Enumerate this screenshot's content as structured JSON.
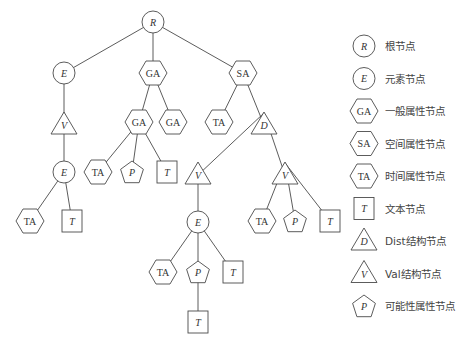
{
  "diagram": {
    "type": "tree",
    "nodes": [
      {
        "id": "R",
        "kind": "circle",
        "label": "R",
        "italic": true,
        "x": 153,
        "y": 22
      },
      {
        "id": "E1",
        "kind": "circle",
        "label": "E",
        "italic": true,
        "x": 64,
        "y": 73
      },
      {
        "id": "GA1",
        "kind": "hexagon",
        "label": "GA",
        "italic": false,
        "x": 153,
        "y": 73
      },
      {
        "id": "SA1",
        "kind": "hexagon",
        "label": "SA",
        "italic": false,
        "x": 243,
        "y": 73
      },
      {
        "id": "V1",
        "kind": "triangle",
        "label": "V",
        "italic": true,
        "x": 64,
        "y": 125
      },
      {
        "id": "GA2",
        "kind": "hexagon",
        "label": "GA",
        "italic": false,
        "x": 139,
        "y": 122
      },
      {
        "id": "GA3",
        "kind": "hexagon",
        "label": "GA",
        "italic": false,
        "x": 173,
        "y": 122
      },
      {
        "id": "TA1",
        "kind": "hexagon",
        "label": "TA",
        "italic": false,
        "x": 219,
        "y": 122
      },
      {
        "id": "D1",
        "kind": "triangle",
        "label": "D",
        "italic": true,
        "x": 264,
        "y": 125
      },
      {
        "id": "E2",
        "kind": "circle",
        "label": "E",
        "italic": true,
        "x": 64,
        "y": 172
      },
      {
        "id": "TA2",
        "kind": "hexagon",
        "label": "TA",
        "italic": false,
        "x": 98,
        "y": 172
      },
      {
        "id": "P1",
        "kind": "pentagon",
        "label": "P",
        "italic": true,
        "x": 132,
        "y": 172
      },
      {
        "id": "T1",
        "kind": "square",
        "label": "T",
        "italic": true,
        "x": 167,
        "y": 172
      },
      {
        "id": "V2",
        "kind": "triangle",
        "label": "V",
        "italic": true,
        "x": 198,
        "y": 175
      },
      {
        "id": "V3",
        "kind": "triangle",
        "label": "V",
        "italic": true,
        "x": 285,
        "y": 175
      },
      {
        "id": "TA3",
        "kind": "hexagon",
        "label": "TA",
        "italic": false,
        "x": 30,
        "y": 221
      },
      {
        "id": "T2",
        "kind": "square",
        "label": "T",
        "italic": true,
        "x": 72,
        "y": 221
      },
      {
        "id": "E3",
        "kind": "circle",
        "label": "E",
        "italic": true,
        "x": 198,
        "y": 222
      },
      {
        "id": "TA4",
        "kind": "hexagon",
        "label": "TA",
        "italic": false,
        "x": 262,
        "y": 221
      },
      {
        "id": "P2",
        "kind": "pentagon",
        "label": "P",
        "italic": true,
        "x": 295,
        "y": 221
      },
      {
        "id": "T3",
        "kind": "square",
        "label": "T",
        "italic": true,
        "x": 330,
        "y": 221
      },
      {
        "id": "TA5",
        "kind": "hexagon",
        "label": "TA",
        "italic": false,
        "x": 163,
        "y": 272
      },
      {
        "id": "P3",
        "kind": "pentagon",
        "label": "P",
        "italic": true,
        "x": 198,
        "y": 272
      },
      {
        "id": "T4",
        "kind": "square",
        "label": "T",
        "italic": true,
        "x": 233,
        "y": 272
      },
      {
        "id": "T5",
        "kind": "square",
        "label": "T",
        "italic": true,
        "x": 198,
        "y": 322
      }
    ],
    "edges": [
      [
        "R",
        "E1"
      ],
      [
        "R",
        "GA1"
      ],
      [
        "R",
        "SA1"
      ],
      [
        "E1",
        "V1"
      ],
      [
        "V1",
        "E2"
      ],
      [
        "E2",
        "TA3"
      ],
      [
        "E2",
        "T2"
      ],
      [
        "GA1",
        "GA2"
      ],
      [
        "GA1",
        "GA3"
      ],
      [
        "GA2",
        "TA2"
      ],
      [
        "GA2",
        "P1"
      ],
      [
        "GA2",
        "T1"
      ],
      [
        "SA1",
        "TA1"
      ],
      [
        "SA1",
        "D1"
      ],
      [
        "D1",
        "V2"
      ],
      [
        "D1",
        "V3"
      ],
      [
        "V2",
        "E3"
      ],
      [
        "E3",
        "TA5"
      ],
      [
        "E3",
        "P3"
      ],
      [
        "E3",
        "T4"
      ],
      [
        "P3",
        "T5"
      ],
      [
        "V3",
        "TA4"
      ],
      [
        "V3",
        "P2"
      ],
      [
        "V3",
        "T3"
      ]
    ]
  },
  "legend": {
    "items": [
      {
        "kind": "circle",
        "symbol": "R",
        "italic": true,
        "label": "根节点"
      },
      {
        "kind": "circle",
        "symbol": "E",
        "italic": true,
        "label": "元素节点"
      },
      {
        "kind": "hexagon",
        "symbol": "GA",
        "italic": false,
        "label": "一般属性节点"
      },
      {
        "kind": "hexagon",
        "symbol": "SA",
        "italic": false,
        "label": "空间属性节点"
      },
      {
        "kind": "hexagon",
        "symbol": "TA",
        "italic": false,
        "label": "时间属性节点"
      },
      {
        "kind": "square",
        "symbol": "T",
        "italic": true,
        "label": "文本节点"
      },
      {
        "kind": "triangle",
        "symbol": "D",
        "italic": true,
        "label": "Dist结构节点"
      },
      {
        "kind": "triangle",
        "symbol": "V",
        "italic": true,
        "label": "Val结构节点"
      },
      {
        "kind": "pentagon",
        "symbol": "P",
        "italic": true,
        "label": "可能性属性节点"
      }
    ]
  },
  "colors": {
    "stroke": "#4a4a4a",
    "text": "#333333",
    "background": "#ffffff"
  }
}
